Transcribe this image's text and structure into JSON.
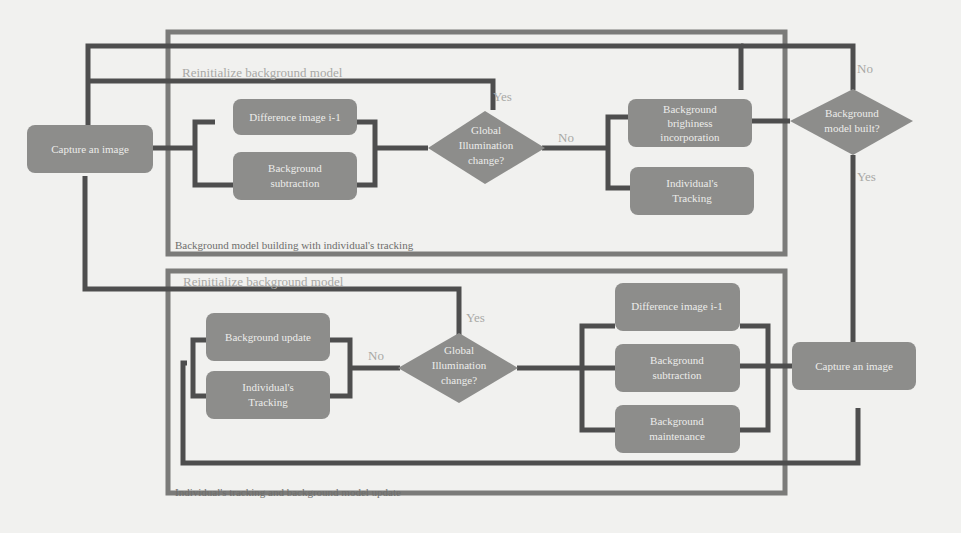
{
  "figure": {
    "top_section": {
      "caption": "Background model building with individual's tracking",
      "reinit_label": "Reinitialize background model",
      "nodes": {
        "capture": "Capture an image",
        "difference_line1": "Difference image i-1",
        "bg_sub_line1": "Background",
        "bg_sub_line2": "subtraction",
        "decision_line1": "Global",
        "decision_line2": "Illumination",
        "decision_line3": "change?",
        "brightness_line1": "Background",
        "brightness_line2": "brighiness",
        "brightness_line3": "incorporation",
        "tracking_line1": "Individual's",
        "tracking_line2": "Tracking",
        "built_line1": "Background",
        "built_line2": "model built?"
      },
      "edge_labels": {
        "yes_illum": "Yes",
        "no_illum": "No",
        "no_built": "No",
        "yes_built": "Yes"
      }
    },
    "bottom_section": {
      "caption": "Individual's tracking and background model update",
      "reinit_label": "Reinitialize background model",
      "nodes": {
        "update": "Background update",
        "tracking_line1": "Individual's",
        "tracking_line2": "Tracking",
        "decision_line1": "Global",
        "decision_line2": "Illumination",
        "decision_line3": "change?",
        "difference_line1": "Difference image i-1",
        "bg_sub_line1": "Background",
        "bg_sub_line2": "subtraction",
        "maint_line1": "Background",
        "maint_line2": "maintenance",
        "capture": "Capture an image"
      },
      "edge_labels": {
        "yes_illum": "Yes",
        "no_illum": "No"
      }
    },
    "colors": {
      "box_fill": "#8d8d8b",
      "connector": "#4e4e4e",
      "frame": "#7b7b79",
      "page_bg": "#f1f1ef"
    }
  }
}
